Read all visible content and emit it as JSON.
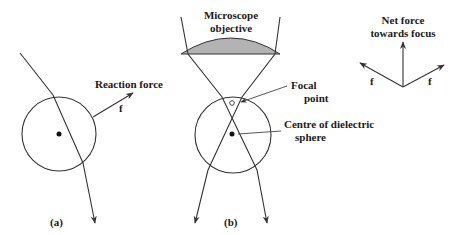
{
  "figure": {
    "colors": {
      "line": "#333333",
      "lens_fill": "#b3b3b3",
      "background": "#ffffff"
    },
    "panel_a": {
      "label": "(a)",
      "force_label": "Reaction force",
      "force_symbol": "f",
      "elements": [
        "dielectric-sphere",
        "refracted-ray",
        "reaction-force-arrow",
        "sphere-centre-dot"
      ]
    },
    "panel_b": {
      "label": "(b)",
      "objective_label_line1": "Microscope",
      "objective_label_line2": "objective",
      "focal_label_line1": "Focal",
      "focal_label_line2": "point",
      "centre_label_line1": "Centre of dielectric",
      "centre_label_line2": "sphere"
    },
    "force_diagram": {
      "title_line1": "Net force",
      "title_line2": "towards focus",
      "left_force_symbol": "f",
      "right_force_symbol": "f"
    }
  }
}
